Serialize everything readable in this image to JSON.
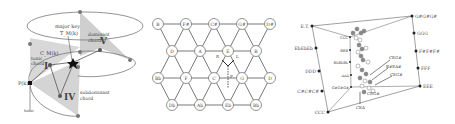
{
  "panel_a": {
    "labels": {
      "major_key": "major key",
      "major_key_sym": "T_M(k)",
      "dominant": "dominant",
      "chord1": "chord",
      "roman_V": "V",
      "CM": "C_M(k)",
      "tonic": "tonic",
      "chord2": "chord",
      "roman_I": "I",
      "Pk": "P(k)",
      "roman_IV": "IV",
      "subdominant": "subdominant",
      "chord3": "chord",
      "tonic_bottom": "tonic"
    }
  },
  "panel_b": {
    "rows": [
      [
        "B",
        "F#",
        "C#",
        "G#",
        "D#"
      ],
      [
        "D",
        "A",
        "E",
        "B"
      ],
      [
        "Bb",
        "F",
        "C",
        "G",
        "D"
      ],
      [
        "Db",
        "Ab",
        "Eb",
        "Bb"
      ]
    ],
    "arrows": {
      "R": "R",
      "L": "L",
      "P": "P"
    }
  },
  "panel_c": {
    "left_axis": [
      "E.T.",
      "EbEbEb",
      "DDD",
      "C#C#C#",
      "CCC"
    ],
    "right_axis": [
      "G#G#G#",
      "GGG",
      "F#F#F#",
      "FFF",
      "EEE"
    ],
    "inner_labels": [
      "CCC",
      "BBB",
      "BbBbBb",
      "AAA",
      "G#G#G#"
    ],
    "callouts": [
      "CEG#",
      "B#EA#",
      "CEG#",
      "CEG#",
      "CEA"
    ]
  }
}
